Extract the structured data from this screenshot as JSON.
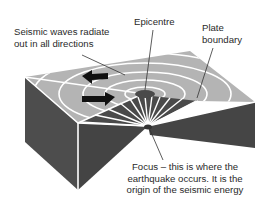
{
  "diagram": {
    "labels": {
      "seismic_waves": [
        "Seismic waves radiate",
        "out in all directions"
      ],
      "epicentre": [
        "Epicentre"
      ],
      "plate_boundary": [
        "Plate",
        "boundary"
      ],
      "focus": [
        "Focus – this is where the",
        "earthquake occurs. It is the",
        "origin of the seismic energy"
      ]
    },
    "colors": {
      "top_surface": "#b3b3b3",
      "side_face": "#4a4a4a",
      "wave_rings": "#ffffff",
      "arrows": "#111111",
      "leader_lines": "#333333",
      "text": "#2a2a2a"
    },
    "icons": [
      "arrow-left-icon",
      "arrow-right-icon"
    ]
  }
}
